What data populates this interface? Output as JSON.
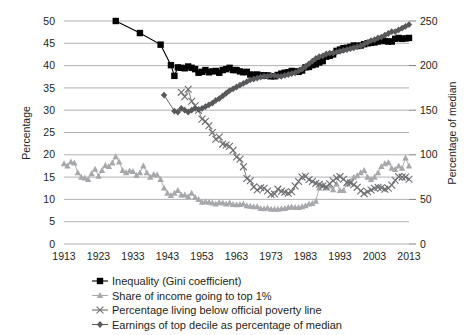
{
  "chart_data": {
    "type": "line",
    "title": "",
    "xlabel": "",
    "ylabel": "Percentage",
    "y2label": "Percentage of median",
    "grid": true,
    "legend_position": "bottom",
    "xlim": [
      1913,
      2013
    ],
    "ylim": [
      0,
      50
    ],
    "y2lim": [
      0,
      250
    ],
    "xticks": [
      "1913",
      "1923",
      "1933",
      "1943",
      "1953",
      "1963",
      "1973",
      "1983",
      "1993",
      "2003",
      "2013"
    ],
    "yticks": [
      "0",
      "5",
      "10",
      "15",
      "20",
      "25",
      "30",
      "35",
      "40",
      "45",
      "50"
    ],
    "y2ticks": [
      "0",
      "50",
      "100",
      "150",
      "200",
      "250"
    ],
    "series": [
      {
        "name": "Inequality (Gini coefficient)",
        "marker": "square",
        "color": "#000000",
        "axis": "left",
        "x": [
          1928,
          1935,
          1941,
          1944,
          1945,
          1946,
          1947,
          1948,
          1949,
          1950,
          1951,
          1952,
          1953,
          1954,
          1955,
          1956,
          1957,
          1958,
          1959,
          1960,
          1961,
          1962,
          1963,
          1964,
          1965,
          1966,
          1967,
          1968,
          1969,
          1970,
          1971,
          1972,
          1973,
          1974,
          1975,
          1976,
          1977,
          1978,
          1979,
          1980,
          1981,
          1982,
          1983,
          1984,
          1985,
          1986,
          1987,
          1988,
          1989,
          1990,
          1991,
          1992,
          1993,
          1994,
          1995,
          1996,
          1997,
          1998,
          1999,
          2000,
          2001,
          2002,
          2003,
          2004,
          2005,
          2006,
          2007,
          2008,
          2009,
          2010,
          2011,
          2012,
          2013
        ],
        "values": [
          50.0,
          47.3,
          44.7,
          40.1,
          37.7,
          39.6,
          39.5,
          39.4,
          39.8,
          39.5,
          39.2,
          38.4,
          38.6,
          39.0,
          38.5,
          38.7,
          38.8,
          38.4,
          39.0,
          39.2,
          39.5,
          39.0,
          39.0,
          38.7,
          38.5,
          38.6,
          38.0,
          37.9,
          38.0,
          37.8,
          37.8,
          37.8,
          37.6,
          37.6,
          37.9,
          38.2,
          38.4,
          38.5,
          38.8,
          38.7,
          38.6,
          38.9,
          39.6,
          39.7,
          40.1,
          40.3,
          40.7,
          41.0,
          42.0,
          42.2,
          42.5,
          43.3,
          43.6,
          43.9,
          44.0,
          44.2,
          44.5,
          44.4,
          44.5,
          44.8,
          45.0,
          45.1,
          45.2,
          45.4,
          45.6,
          45.5,
          45.4,
          45.4,
          46.0,
          46.2,
          46.0,
          46.1,
          46.2
        ]
      },
      {
        "name": "Share of income going to top 1%",
        "marker": "triangle",
        "color": "#a6a8ab",
        "axis": "left",
        "x": [
          1913,
          1914,
          1915,
          1916,
          1917,
          1918,
          1919,
          1920,
          1921,
          1922,
          1923,
          1924,
          1925,
          1926,
          1927,
          1928,
          1929,
          1930,
          1931,
          1932,
          1933,
          1934,
          1935,
          1936,
          1937,
          1938,
          1939,
          1940,
          1941,
          1942,
          1943,
          1944,
          1945,
          1946,
          1947,
          1948,
          1949,
          1950,
          1951,
          1952,
          1953,
          1954,
          1955,
          1956,
          1957,
          1958,
          1959,
          1960,
          1961,
          1962,
          1963,
          1964,
          1965,
          1966,
          1967,
          1968,
          1969,
          1970,
          1971,
          1972,
          1973,
          1974,
          1975,
          1976,
          1977,
          1978,
          1979,
          1980,
          1981,
          1982,
          1983,
          1984,
          1985,
          1986,
          1987,
          1988,
          1989,
          1990,
          1991,
          1992,
          1993,
          1994,
          1995,
          1996,
          1997,
          1998,
          1999,
          2000,
          2001,
          2002,
          2003,
          2004,
          2005,
          2006,
          2007,
          2008,
          2009,
          2010,
          2011,
          2012,
          2013
        ],
        "values": [
          18.0,
          17.5,
          18.4,
          18.2,
          16.0,
          15.0,
          14.8,
          14.5,
          15.8,
          16.8,
          15.2,
          16.5,
          17.6,
          17.4,
          18.2,
          19.6,
          18.4,
          16.5,
          16.0,
          16.4,
          16.3,
          15.4,
          16.0,
          17.5,
          16.0,
          15.0,
          15.6,
          15.5,
          14.5,
          12.6,
          11.4,
          10.9,
          11.4,
          12.0,
          11.0,
          11.0,
          10.6,
          11.4,
          10.5,
          10.0,
          9.4,
          9.5,
          9.4,
          9.2,
          9.0,
          9.3,
          9.2,
          9.0,
          9.2,
          8.9,
          8.8,
          8.9,
          9.0,
          8.6,
          8.5,
          8.4,
          8.4,
          8.0,
          7.9,
          8.1,
          7.8,
          7.8,
          7.8,
          7.9,
          8.0,
          8.2,
          8.3,
          8.2,
          8.2,
          8.4,
          8.6,
          9.0,
          9.1,
          9.6,
          12.6,
          13.2,
          12.6,
          13.0,
          12.2,
          13.5,
          12.0,
          12.0,
          13.5,
          14.0,
          15.0,
          15.3,
          16.0,
          16.5,
          15.0,
          14.5,
          15.0,
          16.0,
          17.4,
          18.0,
          18.3,
          17.0,
          16.7,
          17.5,
          17.0,
          19.3,
          17.5
        ]
      },
      {
        "name": "Percentage living below official poverty line",
        "marker": "cross",
        "color": "#6d6e71",
        "axis": "left",
        "x": [
          1947,
          1948,
          1949,
          1950,
          1951,
          1952,
          1953,
          1954,
          1955,
          1956,
          1957,
          1958,
          1959,
          1960,
          1961,
          1962,
          1963,
          1964,
          1965,
          1966,
          1967,
          1968,
          1969,
          1970,
          1971,
          1972,
          1973,
          1974,
          1975,
          1976,
          1977,
          1978,
          1979,
          1980,
          1981,
          1982,
          1983,
          1984,
          1985,
          1986,
          1987,
          1988,
          1989,
          1990,
          1991,
          1992,
          1993,
          1994,
          1995,
          1996,
          1997,
          1998,
          1999,
          2000,
          2001,
          2002,
          2003,
          2004,
          2005,
          2006,
          2007,
          2008,
          2009,
          2010,
          2011,
          2012,
          2013
        ],
        "values": [
          34.0,
          33.0,
          34.7,
          32.0,
          31.0,
          30.0,
          28.0,
          27.5,
          26.5,
          25.0,
          23.5,
          24.0,
          22.4,
          22.2,
          21.9,
          21.0,
          19.5,
          19.0,
          17.3,
          14.7,
          14.2,
          12.8,
          12.1,
          12.6,
          12.5,
          11.9,
          11.1,
          11.2,
          12.3,
          11.8,
          11.6,
          11.4,
          11.7,
          13.0,
          14.0,
          15.0,
          15.2,
          14.4,
          14.0,
          13.6,
          13.4,
          13.0,
          12.8,
          13.5,
          14.2,
          14.8,
          15.1,
          14.5,
          13.8,
          13.7,
          13.3,
          12.7,
          11.9,
          11.3,
          11.7,
          12.1,
          12.5,
          12.7,
          12.6,
          12.3,
          12.5,
          13.2,
          14.3,
          15.1,
          15.0,
          15.0,
          14.5
        ]
      },
      {
        "name": "Earnings of top decile as percentage of median",
        "marker": "diamond",
        "color": "#58595b",
        "axis": "right",
        "x": [
          1942,
          1945,
          1946,
          1947,
          1948,
          1949,
          1950,
          1951,
          1952,
          1953,
          1954,
          1955,
          1956,
          1957,
          1958,
          1959,
          1960,
          1961,
          1962,
          1963,
          1964,
          1965,
          1966,
          1967,
          1968,
          1969,
          1970,
          1971,
          1972,
          1973,
          1974,
          1975,
          1976,
          1977,
          1978,
          1979,
          1980,
          1981,
          1982,
          1983,
          1984,
          1985,
          1986,
          1987,
          1988,
          1989,
          1990,
          1991,
          1992,
          1993,
          1994,
          1995,
          1996,
          1997,
          1998,
          1999,
          2000,
          2001,
          2002,
          2003,
          2004,
          2005,
          2006,
          2007,
          2008,
          2009,
          2010,
          2011,
          2012,
          2013
        ],
        "values": [
          167,
          149,
          148,
          152,
          150,
          148,
          150,
          152,
          151,
          152,
          154,
          156,
          158,
          161,
          163,
          166,
          169,
          172,
          174,
          176,
          178,
          180,
          182,
          184,
          185,
          186,
          187,
          188,
          188,
          189,
          189,
          188,
          188,
          189,
          190,
          191,
          192,
          194,
          196,
          199,
          202,
          205,
          208,
          210,
          211,
          213,
          214,
          214,
          215,
          216,
          217,
          218,
          219,
          220,
          221,
          222,
          224,
          226,
          228,
          229,
          231,
          232,
          234,
          236,
          238,
          238,
          240,
          242,
          244,
          246
        ]
      }
    ]
  },
  "axes": {
    "left_title": "Percentage",
    "right_title": "Percentage of median"
  },
  "legend": {
    "items": [
      {
        "label": "Inequality (Gini coefficient)",
        "marker": "square",
        "color": "#000000"
      },
      {
        "label": "Share of income going to top 1%",
        "marker": "triangle",
        "color": "#a6a8ab"
      },
      {
        "label": "Percentage living below official poverty line",
        "marker": "cross",
        "color": "#6d6e71"
      },
      {
        "label": "Earnings of top decile as percentage of median",
        "marker": "diamond",
        "color": "#58595b"
      }
    ]
  },
  "colors": {
    "background": "#ffffff",
    "gridline": "#a7a9ac",
    "text": "#231f20"
  }
}
